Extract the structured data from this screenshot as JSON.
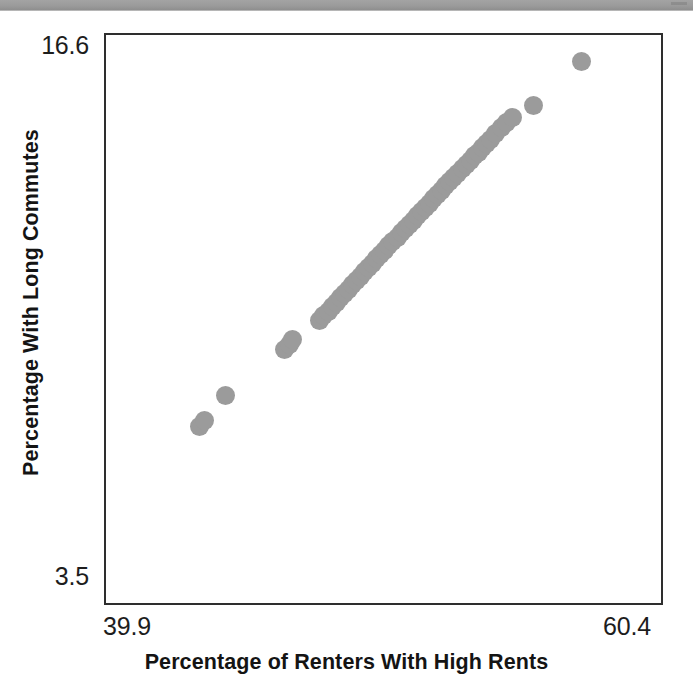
{
  "chart_data": {
    "type": "scatter",
    "title": "",
    "xlabel": "Percentage of Renters With High Rents",
    "ylabel": "Percentage With Long Commutes",
    "xlim": [
      39.9,
      60.4
    ],
    "ylim": [
      3.5,
      16.6
    ],
    "xticks": [
      "39.9",
      "60.4"
    ],
    "yticks": [
      "3.5",
      "16.6"
    ],
    "grid": false,
    "legend": null,
    "marker": {
      "shape": "circle",
      "color": "#9b9b9b",
      "size_px": 19
    },
    "frame": {
      "color": "#2e2e2e",
      "width_px": 2
    },
    "series": [
      {
        "name": "observations",
        "points": [
          [
            43.35,
            7.57
          ],
          [
            43.52,
            7.71
          ],
          [
            44.33,
            8.29
          ],
          [
            46.5,
            9.35
          ],
          [
            46.66,
            9.46
          ],
          [
            46.8,
            9.57
          ],
          [
            47.8,
            10.01
          ],
          [
            47.95,
            10.12
          ],
          [
            48.1,
            10.23
          ],
          [
            48.25,
            10.33
          ],
          [
            48.4,
            10.44
          ],
          [
            48.55,
            10.54
          ],
          [
            48.7,
            10.64
          ],
          [
            48.85,
            10.74
          ],
          [
            49.0,
            10.84
          ],
          [
            49.15,
            10.94
          ],
          [
            49.3,
            11.04
          ],
          [
            49.45,
            11.14
          ],
          [
            49.6,
            11.24
          ],
          [
            49.75,
            11.34
          ],
          [
            49.9,
            11.44
          ],
          [
            50.05,
            11.54
          ],
          [
            50.2,
            11.64
          ],
          [
            50.35,
            11.74
          ],
          [
            50.5,
            11.84
          ],
          [
            50.65,
            11.94
          ],
          [
            50.8,
            12.04
          ],
          [
            50.95,
            12.13
          ],
          [
            51.1,
            12.23
          ],
          [
            51.25,
            12.33
          ],
          [
            51.4,
            12.43
          ],
          [
            51.55,
            12.53
          ],
          [
            51.7,
            12.62
          ],
          [
            51.85,
            12.72
          ],
          [
            52.0,
            12.82
          ],
          [
            52.15,
            12.92
          ],
          [
            52.3,
            13.02
          ],
          [
            52.45,
            13.12
          ],
          [
            52.6,
            13.22
          ],
          [
            52.75,
            13.31
          ],
          [
            52.9,
            13.41
          ],
          [
            53.05,
            13.51
          ],
          [
            53.2,
            13.61
          ],
          [
            53.35,
            13.71
          ],
          [
            53.5,
            13.81
          ],
          [
            53.65,
            13.9
          ],
          [
            53.8,
            14.0
          ],
          [
            53.95,
            14.1
          ],
          [
            54.1,
            14.2
          ],
          [
            54.3,
            14.33
          ],
          [
            54.5,
            14.46
          ],
          [
            54.7,
            14.58
          ],
          [
            54.9,
            14.7
          ],
          [
            55.7,
            14.98
          ],
          [
            57.45,
            16.0
          ]
        ]
      }
    ]
  },
  "axis": {
    "y_max_label": "16.6",
    "y_min_label": "3.5",
    "x_min_label": "39.9",
    "x_max_label": "60.4",
    "y_title": "Percentage With Long Commutes",
    "x_title": "Percentage of Renters With High Rents"
  }
}
